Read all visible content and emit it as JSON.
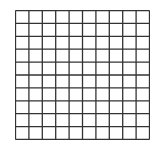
{
  "grid": {
    "rows": 10,
    "cols": 10,
    "left": 15,
    "top": 10,
    "width": 134,
    "height": 129,
    "line_color": "#333333",
    "background": "#ffffff",
    "line_width": 1.3
  }
}
